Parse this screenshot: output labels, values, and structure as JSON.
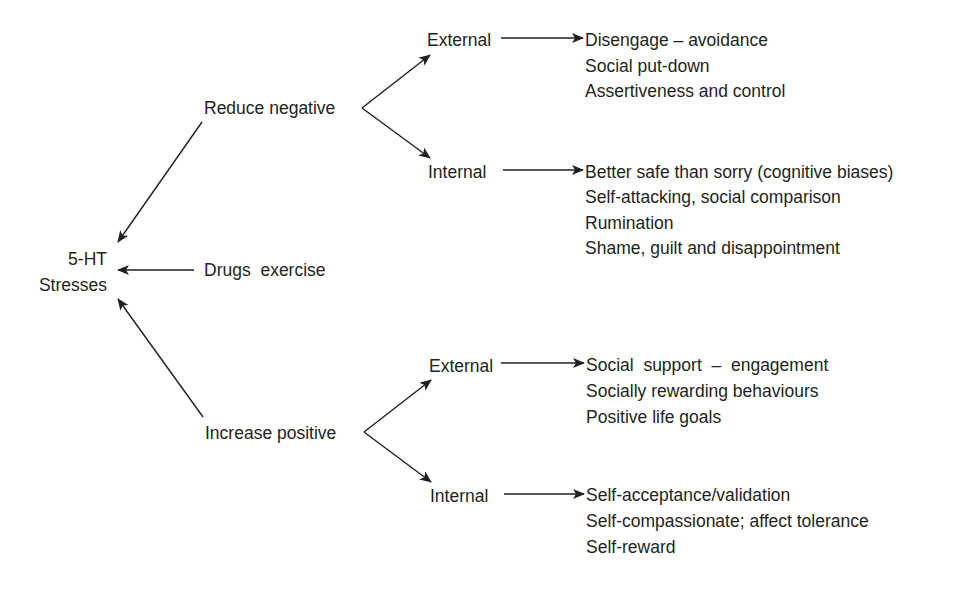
{
  "diagram": {
    "center": {
      "line1": "5-HT",
      "line2": "Stresses"
    },
    "drugs": "Drugs  exercise",
    "reduce": {
      "label": "Reduce negative",
      "external": {
        "label": "External",
        "items": [
          "Disengage – avoidance",
          "Social put-down",
          "Assertiveness and control"
        ]
      },
      "internal": {
        "label": "Internal",
        "items": [
          "Better safe than sorry (cognitive biases)",
          "Self-attacking, social comparison",
          "Rumination",
          "Shame, guilt and disappointment"
        ]
      }
    },
    "increase": {
      "label": "Increase positive",
      "external": {
        "label": "External",
        "items": [
          "Social  support  –  engagement",
          "Socially rewarding behaviours",
          "Positive life goals"
        ]
      },
      "internal": {
        "label": "Internal",
        "items": [
          "Self-acceptance/validation",
          "Self-compassionate; affect tolerance",
          "Self-reward"
        ]
      }
    },
    "colors": {
      "ink": "#231f20",
      "background": "#ffffff"
    }
  }
}
